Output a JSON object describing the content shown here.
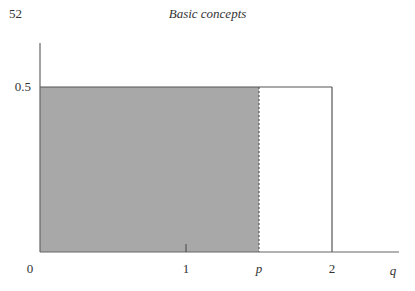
{
  "page": {
    "page_number": "52",
    "running_head": "Basic concepts"
  },
  "chart_data": {
    "type": "area",
    "title": "",
    "xlabel": "q",
    "ylabel": "",
    "xlim": [
      0,
      2.35
    ],
    "ylim": [
      0,
      0.6
    ],
    "grid": false,
    "x_ticks": [
      {
        "value": 0,
        "label": "0"
      },
      {
        "value": 1,
        "label": "1"
      },
      {
        "value": 1.5,
        "label": "p",
        "italic": true
      },
      {
        "value": 2,
        "label": "2"
      }
    ],
    "y_ticks": [
      {
        "value": 0.5,
        "label": "0.5"
      }
    ],
    "density": {
      "description": "Uniform density of height 0.5 on [0, 2]",
      "x": [
        0,
        2
      ],
      "height": 0.5
    },
    "shaded_region": {
      "from": 0,
      "to": 1.5,
      "label": "p",
      "fill": "#a8a8a8",
      "boundary": "dashed"
    },
    "unshaded_region": {
      "from": 1.5,
      "to": 2
    }
  }
}
